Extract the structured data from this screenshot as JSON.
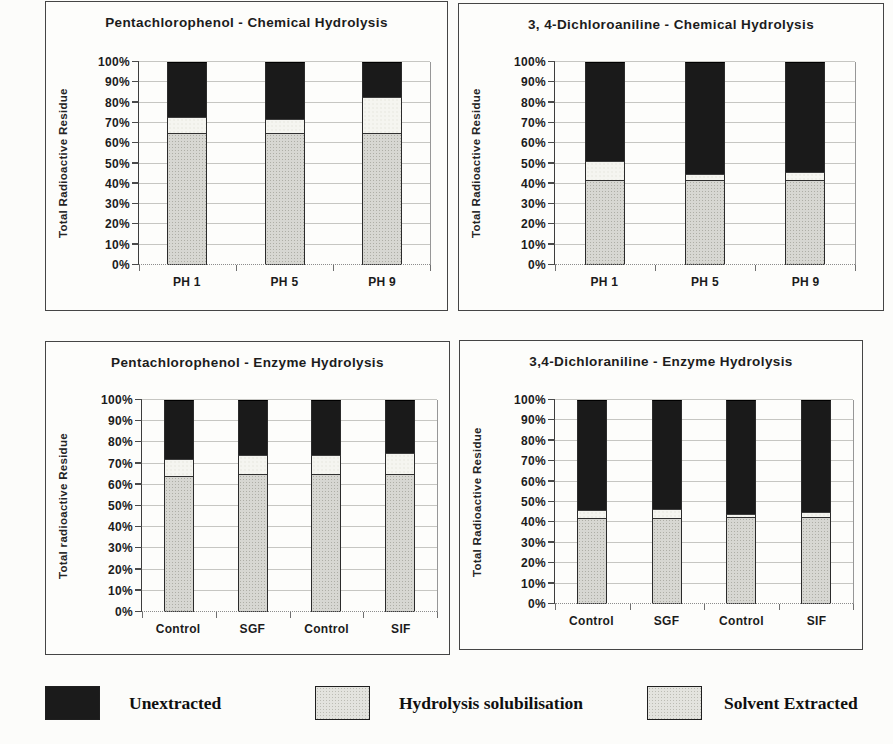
{
  "colors": {
    "unextracted": "#1a1a1a",
    "hydrolysis_solubilisation": "#f5f5f0",
    "solvent_extracted": "#d7d7d2",
    "gridline": "#c6c6c2",
    "panel_border": "#454545"
  },
  "legend": {
    "items": [
      {
        "label": "Unextracted",
        "swatch": "black"
      },
      {
        "label": "Hydrolysis solubilisation",
        "swatch": "gray"
      },
      {
        "label": "Solvent Extracted",
        "swatch": "gray"
      }
    ]
  },
  "chart_data": [
    {
      "type": "bar",
      "subtype": "stacked-percent",
      "title": "Pentachlorophenol - Chemical Hydrolysis",
      "ylabel": "Total Radioactive Residue",
      "xlabel": "",
      "categories": [
        "PH 1",
        "PH 5",
        "PH 9"
      ],
      "series": [
        {
          "name": "Solvent Extracted",
          "texture": "gray",
          "values": [
            65,
            65,
            65
          ]
        },
        {
          "name": "Hydrolysis solubilisation",
          "texture": "white",
          "values": [
            8,
            7,
            18
          ]
        },
        {
          "name": "Unextracted",
          "texture": "black",
          "values": [
            27,
            28,
            17
          ]
        }
      ],
      "ylim": [
        0,
        100
      ],
      "ytick_labels": [
        "0%",
        "10%",
        "20%",
        "30%",
        "40%",
        "50%",
        "60%",
        "70%",
        "80%",
        "90%",
        "100%"
      ],
      "grid": true,
      "legend_position": "none"
    },
    {
      "type": "bar",
      "subtype": "stacked-percent",
      "title": "3, 4-Dichloroaniline - Chemical Hydrolysis",
      "ylabel": "Total Radioactive Residue",
      "xlabel": "",
      "categories": [
        "PH 1",
        "PH 5",
        "PH 9"
      ],
      "series": [
        {
          "name": "Solvent Extracted",
          "texture": "gray",
          "values": [
            42,
            42,
            42
          ]
        },
        {
          "name": "Hydrolysis solubilisation",
          "texture": "white",
          "values": [
            9,
            3,
            4
          ]
        },
        {
          "name": "Unextracted",
          "texture": "black",
          "values": [
            49,
            55,
            54
          ]
        }
      ],
      "ylim": [
        0,
        100
      ],
      "ytick_labels": [
        "0%",
        "10%",
        "20%",
        "30%",
        "40%",
        "50%",
        "60%",
        "70%",
        "80%",
        "90%",
        "100%"
      ],
      "grid": true,
      "legend_position": "none"
    },
    {
      "type": "bar",
      "subtype": "stacked-percent",
      "title": "Pentachlorophenol - Enzyme Hydrolysis",
      "ylabel": "Total radioactive Residue",
      "xlabel": "",
      "categories": [
        "Control",
        "SGF",
        "Control",
        "SIF"
      ],
      "series": [
        {
          "name": "Solvent Extracted",
          "texture": "gray",
          "values": [
            64,
            65,
            65,
            65
          ]
        },
        {
          "name": "Hydrolysis solubilisation",
          "texture": "white",
          "values": [
            8,
            9,
            9,
            10
          ]
        },
        {
          "name": "Unextracted",
          "texture": "black",
          "values": [
            28,
            26,
            26,
            25
          ]
        }
      ],
      "ylim": [
        0,
        100
      ],
      "ytick_labels": [
        "0%",
        "10%",
        "20%",
        "30%",
        "40%",
        "50%",
        "60%",
        "70%",
        "80%",
        "90%",
        "100%"
      ],
      "grid": true,
      "legend_position": "none"
    },
    {
      "type": "bar",
      "subtype": "stacked-percent",
      "title": "3,4-Dichloraniline - Enzyme Hydrolysis",
      "ylabel": "Total Radioactive Residue",
      "xlabel": "",
      "categories": [
        "Control",
        "SGF",
        "Control",
        "SIF"
      ],
      "series": [
        {
          "name": "Solvent Extracted",
          "texture": "gray",
          "values": [
            42,
            42,
            42.5,
            42.5
          ]
        },
        {
          "name": "Hydrolysis solubilisation",
          "texture": "white",
          "values": [
            4,
            4.5,
            1.5,
            2.5
          ]
        },
        {
          "name": "Unextracted",
          "texture": "black",
          "values": [
            54,
            53.5,
            56,
            55
          ]
        }
      ],
      "ylim": [
        0,
        100
      ],
      "ytick_labels": [
        "0%",
        "10%",
        "20%",
        "30%",
        "40%",
        "50%",
        "60%",
        "70%",
        "80%",
        "90%",
        "100%"
      ],
      "grid": true,
      "legend_position": "none"
    }
  ]
}
